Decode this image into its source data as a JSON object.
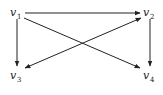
{
  "diagram": {
    "type": "directed-graph",
    "nodes": [
      {
        "id": "v1",
        "letter": "v",
        "sub": "1",
        "x": 17,
        "y": 13
      },
      {
        "id": "v2",
        "letter": "v",
        "sub": "2",
        "x": 148,
        "y": 13
      },
      {
        "id": "v3",
        "letter": "v",
        "sub": "3",
        "x": 17,
        "y": 76
      },
      {
        "id": "v4",
        "letter": "v",
        "sub": "4",
        "x": 148,
        "y": 76
      }
    ],
    "edges": [
      {
        "from": "v1",
        "to": "v2",
        "directed": true
      },
      {
        "from": "v1",
        "to": "v3",
        "directed": true
      },
      {
        "from": "v1",
        "to": "v4",
        "directed": true
      },
      {
        "from": "v2",
        "to": "v4",
        "directed": true
      },
      {
        "from": "v2",
        "to": "v3",
        "directed": true,
        "bidirectional": true
      }
    ]
  }
}
